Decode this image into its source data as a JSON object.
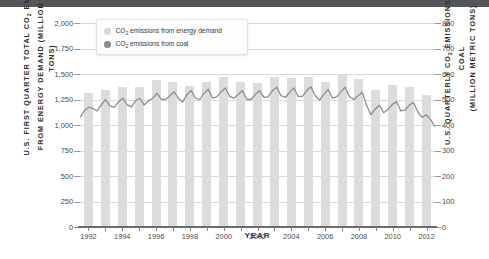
{
  "chart_data": {
    "type": "bar",
    "title": "",
    "xlabel": "YEAR",
    "ylabel": "U.S. FIRST QUARTER TOTAL CO2 EMISSIONS FROM ENERGY DEMAND (MILLION METRIC TONS)",
    "ylabel_right": "U.S. QUARTERLY CO2 EMISSIONS FROM COAL (MILLION METRIC TONS)",
    "ylim": [
      0,
      2000
    ],
    "ylim_right": [
      0,
      800
    ],
    "grid": true,
    "legend_position": "top-left",
    "axis_left": {
      "line1": "U.S. FIRST QUARTER TOTAL CO",
      "sub1": "2",
      "line1b": " EMISSIONS",
      "line2": "FROM ENERGY DEMAND (MILLION METRIC TONS)",
      "ticks": [
        "0",
        "250",
        "500",
        "750",
        "1,000",
        "1,250",
        "1,500",
        "1,750",
        "2,000"
      ],
      "tick_values": [
        0,
        250,
        500,
        750,
        1000,
        1250,
        1500,
        1750,
        2000
      ]
    },
    "axis_right": {
      "line1": "U.S. QUARTERLY CO",
      "sub1": "2",
      "line1b": " EMISSIONS FROM COAL",
      "line2": "(MILLION METRIC TONS)",
      "ticks": [
        "0",
        "100",
        "200",
        "300",
        "400",
        "500",
        "600",
        "700",
        "800"
      ],
      "tick_values": [
        0,
        100,
        200,
        300,
        400,
        500,
        600,
        700,
        800
      ]
    },
    "categories": [
      1992,
      1993,
      1994,
      1995,
      1996,
      1997,
      1998,
      1999,
      2000,
      2001,
      2002,
      2003,
      2004,
      2005,
      2006,
      2007,
      2008,
      2009,
      2010,
      2011,
      2012
    ],
    "x_tick_labels": [
      "1992",
      "1994",
      "1996",
      "1998",
      "2000",
      "2002",
      "2004",
      "2006",
      "2008",
      "2010",
      "2012"
    ],
    "series": [
      {
        "name": "CO2 emissions from energy demand",
        "type": "bar",
        "axis": "left",
        "color": "#dcdcdc",
        "values": [
          1310,
          1345,
          1370,
          1375,
          1440,
          1425,
          1385,
          1420,
          1470,
          1425,
          1415,
          1470,
          1460,
          1470,
          1420,
          1500,
          1455,
          1345,
          1390,
          1370,
          1290
        ]
      },
      {
        "name": "CO2 emissions from coal",
        "type": "line",
        "axis": "right",
        "color": "#8d8d8d",
        "quarterly_values": [
          430,
          455,
          470,
          465,
          455,
          480,
          500,
          475,
          470,
          490,
          505,
          480,
          470,
          495,
          505,
          478,
          495,
          505,
          525,
          500,
          500,
          515,
          530,
          505,
          490,
          520,
          535,
          505,
          500,
          525,
          540,
          505,
          510,
          530,
          545,
          512,
          505,
          520,
          535,
          500,
          500,
          520,
          535,
          508,
          510,
          535,
          548,
          515,
          508,
          528,
          545,
          512,
          512,
          535,
          550,
          515,
          498,
          520,
          540,
          505,
          510,
          530,
          548,
          512,
          500,
          515,
          528,
          478,
          440,
          462,
          478,
          448,
          462,
          480,
          492,
          455,
          458,
          478,
          488,
          450,
          430,
          440,
          420,
          392
        ]
      }
    ]
  },
  "legend": {
    "items": [
      {
        "label_a": "CO",
        "sub": "2",
        "label_b": " emissions from energy demand",
        "color": "#d8d8d8",
        "name": "legend-energy-demand"
      },
      {
        "label_a": "CO",
        "sub": "2",
        "label_b": " emissions from coal",
        "color": "#8d8d8d",
        "name": "legend-coal"
      }
    ]
  },
  "colors": {
    "bar": "#dcdcdc",
    "line": "#8d8d8d",
    "grid": "#d8d8d8",
    "axis": "#6b6b6b",
    "header_strip": "#55565a"
  }
}
